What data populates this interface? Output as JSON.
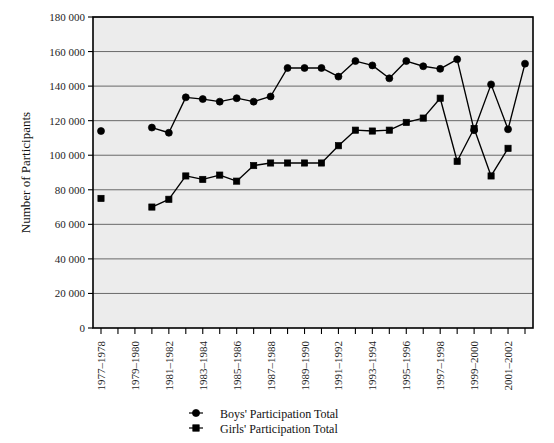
{
  "chart_data": {
    "type": "line",
    "title": "",
    "xlabel": "",
    "ylabel": "Number of Participants",
    "ylim": [
      0,
      180000
    ],
    "ytick_step": 20000,
    "ytick_labels": [
      "0",
      "20 000",
      "40 000",
      "60 000",
      "80 000",
      "100 000",
      "120 000",
      "140 000",
      "160 000",
      "180 000"
    ],
    "ytick_values": [
      0,
      20000,
      40000,
      60000,
      80000,
      100000,
      120000,
      140000,
      160000,
      180000
    ],
    "grid": true,
    "legend_position": "bottom",
    "categories": [
      "1977-1978",
      "1978-1979",
      "1979-1980",
      "1980-1981",
      "1981-1982",
      "1982-1983",
      "1983-1984",
      "1984-1985",
      "1985-1986",
      "1986-1987",
      "1987-1988",
      "1988-1989",
      "1989-1990",
      "1990-1991",
      "1991-1992",
      "1992-1993",
      "1993-1994",
      "1994-1995",
      "1995-1996",
      "1996-1997",
      "1997-1998",
      "1998-1999",
      "1999-2000",
      "2000-2001",
      "2001-2002",
      "2002-2003"
    ],
    "xtick_labels_shown": [
      "1977–1978",
      "1979–1980",
      "1981–1982",
      "1983–1984",
      "1985–1986",
      "1987–1988",
      "1989–1990",
      "1991–1992",
      "1993–1994",
      "1995–1996",
      "1997–1998",
      "1999–2000",
      "2001–2002"
    ],
    "xtick_label_indices": [
      0,
      2,
      4,
      6,
      8,
      10,
      12,
      14,
      16,
      18,
      20,
      22,
      24
    ],
    "series": [
      {
        "name": "Boys' Participation Total",
        "marker": "circle",
        "connected_from_index": 3,
        "values": [
          114000,
          null,
          null,
          116000,
          113000,
          133500,
          132500,
          131000,
          133000,
          131000,
          134000,
          150500,
          150500,
          150500,
          145500,
          154500,
          152000,
          144500,
          154500,
          151500,
          150000,
          155500,
          114500,
          141000,
          115000,
          153000
        ]
      },
      {
        "name": "Girls' Participation Total",
        "marker": "square",
        "connected_from_index": 3,
        "values": [
          75000,
          null,
          null,
          70000,
          74500,
          88000,
          86000,
          88500,
          85000,
          94000,
          95500,
          95500,
          95500,
          95500,
          105500,
          114500,
          114000,
          114500,
          119000,
          121500,
          133000,
          96500,
          115500,
          88000,
          104000,
          null
        ]
      }
    ]
  },
  "legend": {
    "items": [
      {
        "label": "Boys' Participation Total",
        "marker": "circle"
      },
      {
        "label": "Girls' Participation Total",
        "marker": "square"
      }
    ]
  },
  "colors": {
    "series": "#000000",
    "plot_background": "#ececec",
    "gridline": "#5a5a5a",
    "axis": "#000000",
    "page_background": "#ffffff"
  }
}
